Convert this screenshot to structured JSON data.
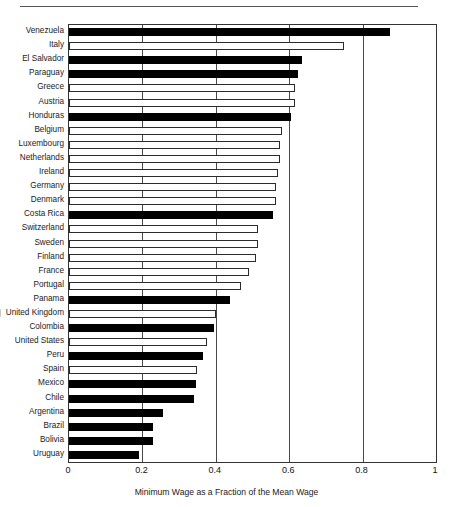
{
  "chart_data": {
    "type": "bar",
    "orientation": "horizontal",
    "title": "",
    "xlabel": "Minimum Wage as a Fraction of the Mean Wage",
    "ylabel": "",
    "xlim": [
      0,
      1
    ],
    "xticks": [
      "0",
      "0.2",
      "0.4",
      "0.6",
      "0.8",
      "1"
    ],
    "xtick_values": [
      0,
      0.2,
      0.4,
      0.6,
      0.8,
      1
    ],
    "grid": true,
    "legend": null,
    "series_note": "Filled black bars denote Latin American countries; hollow white bars denote OECD/European countries",
    "categories": [
      "Venezuela",
      "Italy",
      "El Salvador",
      "Paraguay",
      "Greece",
      "Austria",
      "Honduras",
      "Belgium",
      "Luxembourg",
      "Netherlands",
      "Ireland",
      "Germany",
      "Denmark",
      "Costa Rica",
      "Switzerland",
      "Sweden",
      "Finland",
      "France",
      "Portugal",
      "Panama",
      "United Kingdom",
      "Colombia",
      "United States",
      "Peru",
      "Spain",
      "Mexico",
      "Chile",
      "Argentina",
      "Brazil",
      "Bolivia",
      "Uruguay"
    ],
    "values": [
      0.875,
      0.75,
      0.635,
      0.625,
      0.615,
      0.615,
      0.605,
      0.58,
      0.575,
      0.575,
      0.57,
      0.565,
      0.565,
      0.555,
      0.515,
      0.515,
      0.51,
      0.49,
      0.47,
      0.44,
      0.4,
      0.395,
      0.375,
      0.365,
      0.35,
      0.345,
      0.34,
      0.255,
      0.23,
      0.23,
      0.19
    ],
    "fills": [
      "filled",
      "hollow",
      "filled",
      "filled",
      "hollow",
      "hollow",
      "filled",
      "hollow",
      "hollow",
      "hollow",
      "hollow",
      "hollow",
      "hollow",
      "filled",
      "hollow",
      "hollow",
      "hollow",
      "hollow",
      "hollow",
      "filled",
      "hollow",
      "filled",
      "hollow",
      "filled",
      "hollow",
      "filled",
      "filled",
      "filled",
      "filled",
      "filled",
      "filled"
    ],
    "colors": {
      "filled": "#000000",
      "hollow": "#ffffff",
      "outline": "#2b2b2b",
      "gridline": "#4a4a4a",
      "axis": "#333333",
      "text": "#1a1a1a"
    }
  }
}
